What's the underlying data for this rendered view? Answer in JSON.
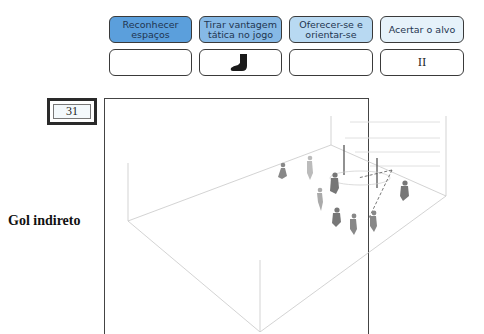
{
  "categories": [
    {
      "label": "Reconhecer espaços",
      "bg": "#5b9fdc"
    },
    {
      "label": "Tirar vantagem tática no jogo",
      "bg": "#86b9e6"
    },
    {
      "label": "Oferecer-se e orientar-se",
      "bg": "#b8d9f2"
    },
    {
      "label": "Acertar o alvo",
      "bg": "#e6f2fa"
    }
  ],
  "slots": [
    {
      "value": "",
      "icon": null
    },
    {
      "value": "",
      "icon": "sock-icon"
    },
    {
      "value": "",
      "icon": null
    },
    {
      "value": "II",
      "icon": null
    }
  ],
  "exercise": {
    "number": "31",
    "title": "Gol indireto"
  }
}
